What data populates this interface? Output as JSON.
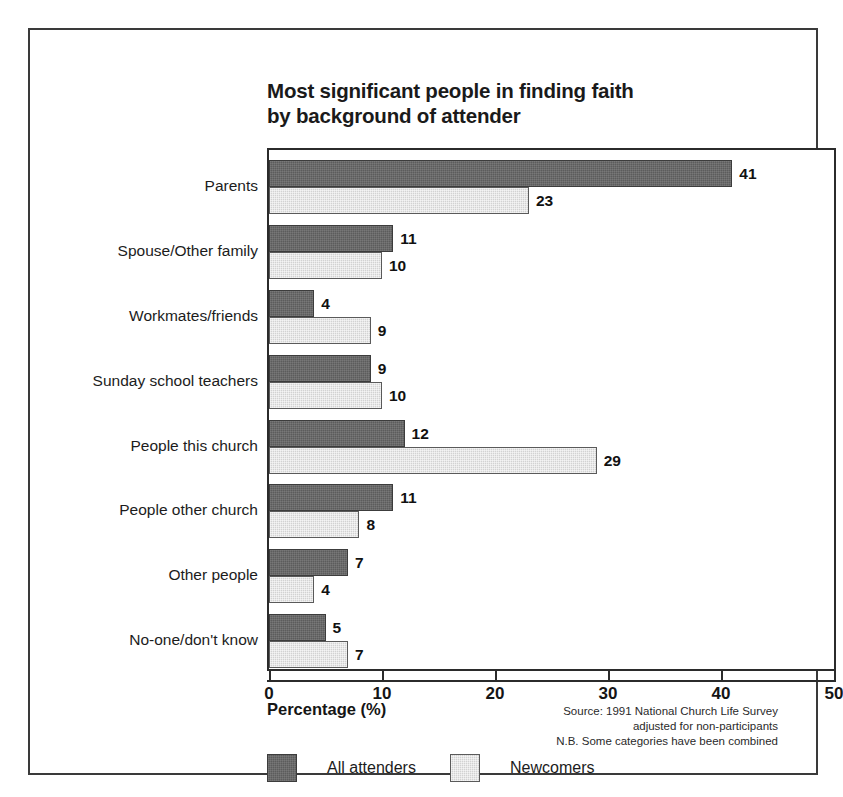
{
  "chart_data": {
    "type": "bar",
    "orientation": "horizontal",
    "title": "Most significant people in finding faith by background of attender",
    "title_lines": [
      "Most significant people in finding faith",
      "by background of attender"
    ],
    "xlabel": "Percentage (%)",
    "ylabel": "",
    "xlim": [
      0,
      50
    ],
    "xticks": [
      0,
      10,
      20,
      30,
      40,
      50
    ],
    "xtick_labels": [
      "0",
      "10",
      "20",
      "30",
      "40",
      "50"
    ],
    "grid": false,
    "legend_position": "bottom-left",
    "categories": [
      "Parents",
      "Spouse/Other family",
      "Workmates/friends",
      "Sunday school teachers",
      "People this church",
      "People other church",
      "Other people",
      "No-one/don't know"
    ],
    "series": [
      {
        "name": "All attenders",
        "color": "#5c5c5c",
        "values": [
          41,
          11,
          4,
          9,
          12,
          11,
          7,
          5
        ]
      },
      {
        "name": "Newcomers",
        "color": "#d2d2d2",
        "values": [
          23,
          10,
          9,
          10,
          29,
          8,
          4,
          7
        ]
      }
    ],
    "annotations": [
      "Source: 1991 National Church Life Survey",
      "adjusted for non-participants",
      "N.B. Some categories have been combined"
    ]
  },
  "source_note": {
    "line1": "Source: 1991 National Church Life Survey",
    "line2": "adjusted for non-participants",
    "line3": "N.B. Some categories have been combined"
  }
}
